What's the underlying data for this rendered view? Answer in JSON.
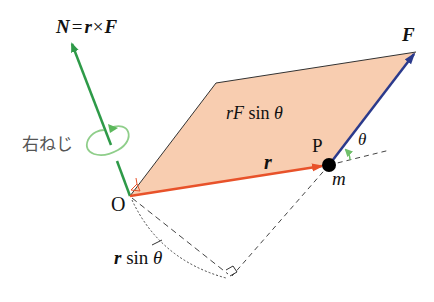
{
  "diagram": {
    "title_formula": {
      "N": "N",
      "eq": "=",
      "r": "r",
      "times": "×",
      "F": "F"
    },
    "labels": {
      "force": "F",
      "position_vector": "r",
      "area_rF": "rF",
      "area_sin": "sin",
      "theta": "θ",
      "point_P": "P",
      "origin": "O",
      "mass": "m",
      "right_screw": "右ねじ",
      "lever_r": "r",
      "lever_sin": "sin",
      "lever_theta": "θ"
    },
    "colors": {
      "torque_vector": "#2e9a48",
      "position_vector": "#e8522a",
      "force_vector": "#2b3a8c",
      "parallelogram_fill": "#f8cdb0",
      "angle_marker": "#5cb85c",
      "rotation_arrow": "#8fce8a"
    }
  }
}
